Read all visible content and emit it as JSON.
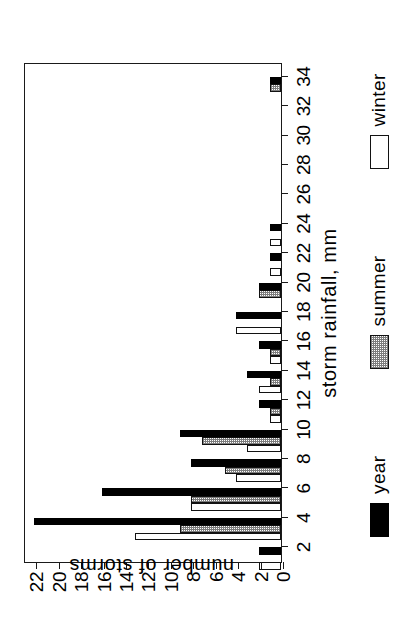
{
  "chart_data": {
    "type": "bar",
    "title": "",
    "orientation": "rotated-90-ccw",
    "xlabel": "storm rainfall, mm",
    "ylabel": "number of storms",
    "categories": [
      2,
      4,
      6,
      8,
      10,
      12,
      14,
      16,
      18,
      20,
      22,
      24,
      26,
      28,
      30,
      32,
      34
    ],
    "xticklabels": [
      "2",
      "4",
      "6",
      "8",
      "10",
      "12",
      "14",
      "16",
      "18",
      "20",
      "22",
      "24",
      "26",
      "28",
      "30",
      "32",
      "34"
    ],
    "yticklabels": [
      "0",
      "2",
      "4",
      "6",
      "8",
      "10",
      "12",
      "14",
      "16",
      "18",
      "20",
      "22"
    ],
    "ylim": [
      0,
      23
    ],
    "xlim": [
      1,
      35
    ],
    "grid": false,
    "legend_position": "below-axis",
    "series": [
      {
        "name": "year",
        "color": "#000000",
        "fill": "solid-black",
        "values": [
          2,
          22,
          16,
          8,
          9,
          2,
          3,
          2,
          4,
          2,
          1,
          1,
          0,
          0,
          0,
          0,
          1
        ]
      },
      {
        "name": "summer",
        "color": "#7d7d7d",
        "fill": "hatched-gray",
        "values": [
          0,
          9,
          8,
          5,
          7,
          1,
          1,
          1,
          0,
          2,
          0,
          0,
          0,
          0,
          0,
          0,
          1
        ]
      },
      {
        "name": "winter",
        "color": "#ffffff",
        "fill": "open-white",
        "values": [
          2,
          13,
          8,
          4,
          3,
          1,
          2,
          1,
          4,
          0,
          1,
          1,
          0,
          0,
          0,
          0,
          0
        ]
      }
    ]
  },
  "legend": {
    "items": [
      {
        "label": "year",
        "swatch": "solid-black"
      },
      {
        "label": "summer",
        "swatch": "hatched-gray"
      },
      {
        "label": "winter",
        "swatch": "open-white"
      }
    ]
  },
  "axes": {
    "value_axis_title": "number of storms",
    "category_axis_title": "storm rainfall, mm"
  }
}
